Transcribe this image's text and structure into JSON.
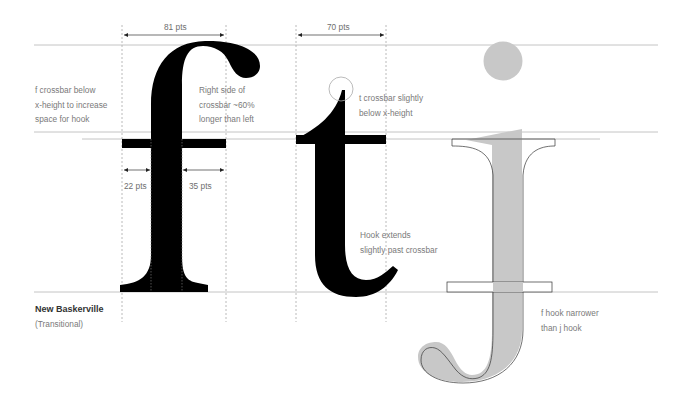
{
  "diagram": {
    "typeface": {
      "name": "New Baskerville",
      "classification": "(Transitional)"
    },
    "glyphs": [
      "f",
      "t",
      "j"
    ],
    "dimensions": {
      "f_width": "81 pts",
      "t_width": "70 pts",
      "f_crossbar_left": "22 pts",
      "f_crossbar_right": "35 pts"
    },
    "annotations": {
      "f_crossbar": [
        "f crossbar below",
        "x-height to increase",
        "space for hook"
      ],
      "f_right_side": [
        "Right side of",
        "crossbar ~60%",
        "longer than left"
      ],
      "t_crossbar": [
        "t crossbar slightly",
        "below x-height"
      ],
      "t_hook": [
        "Hook extends",
        "slightly past crossbar"
      ],
      "j_hook": [
        "f hook narrower",
        "than j hook"
      ]
    },
    "colors": {
      "glyph": "#000000",
      "overlay": "#c8c8c8",
      "guide": "#c4c4c4",
      "text": "#7a7a7a"
    }
  }
}
